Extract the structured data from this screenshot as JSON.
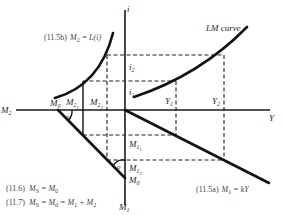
{
  "figure": {
    "type": "four-quadrant LM curve derivation diagram",
    "axes": {
      "vertical_top_label": "i",
      "vertical_bottom_label": "M",
      "vertical_bottom_sub": "1",
      "horizontal_left_label": "M",
      "horizontal_left_sub": "2",
      "horizontal_right_label": "Y"
    },
    "curves": {
      "lm_curve_label": "LM curve",
      "liquidity_eq": "(11.5b)",
      "liquidity_lhs": "M",
      "liquidity_lhs_sub": "2",
      "liquidity_rhs": " = L(i)",
      "transactions_eq": "(11.5a)",
      "transactions_lhs": "M",
      "transactions_lhs_sub": "1",
      "transactions_rhs": " = kY"
    },
    "points": {
      "i1": {
        "base": "i",
        "sub": "1"
      },
      "i2": {
        "base": "i",
        "sub": "2"
      },
      "Y1": {
        "base": "Y",
        "sub": "1"
      },
      "Y2": {
        "base": "Y",
        "sub": "2"
      },
      "M21": {
        "base": "M",
        "sub": "2",
        "subsub": "1"
      },
      "M22": {
        "base": "M",
        "sub": "2",
        "subsub": "2"
      },
      "M11": {
        "base": "M",
        "sub": "1",
        "subsub": "1"
      },
      "M12": {
        "base": "M",
        "sub": "1",
        "subsub": "2"
      },
      "M0_top": {
        "base": "M",
        "sub": "0"
      },
      "M0_bottom": {
        "base": "M",
        "sub": "0"
      }
    },
    "angle_markers": {
      "left": "o",
      "bottom": "o"
    },
    "equations": [
      {
        "num": "(11.6)",
        "text": "M",
        "sub": "S",
        "rest": " = M",
        "rest_sub": "0"
      },
      {
        "num": "(11.7)",
        "text": "M",
        "sub": "S",
        "rest": " = M",
        "rest_sub": "d",
        "tail": " = M",
        "tail_sub": "1",
        "tail2": " + M",
        "tail2_sub": "2"
      }
    ]
  }
}
